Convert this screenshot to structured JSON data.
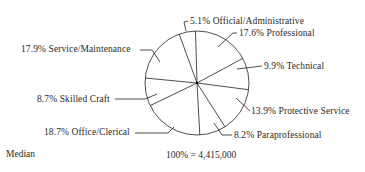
{
  "chart_data": {
    "type": "pie",
    "title": "",
    "total_label": "100% = 4,415,000",
    "total": 4415000,
    "slices": [
      {
        "label": "Official/Administrative",
        "value": 5.1,
        "text": "5.1% Official/Administrative"
      },
      {
        "label": "Professional",
        "value": 17.6,
        "text": "17.6% Professional"
      },
      {
        "label": "Technical",
        "value": 9.9,
        "text": "9.9% Technical"
      },
      {
        "label": "Protective Service",
        "value": 13.9,
        "text": "13.9% Protective Service"
      },
      {
        "label": "Paraprofessional",
        "value": 8.2,
        "text": "8.2% Paraprofessional"
      },
      {
        "label": "Office/Clerical",
        "value": 18.7,
        "text": "18.7% Office/Clerical"
      },
      {
        "label": "Skilled Craft",
        "value": 8.7,
        "text": "8.7% Skilled Craft"
      },
      {
        "label": "Service/Maintenance",
        "value": 17.9,
        "text": "17.9% Service/Maintenance"
      }
    ],
    "legend": "none (leader-line labels)"
  },
  "footer": {
    "total_label": "100% = 4,415,000",
    "median_label": "Median"
  },
  "colors": {
    "line": "#222222",
    "background": "#ffffff"
  }
}
